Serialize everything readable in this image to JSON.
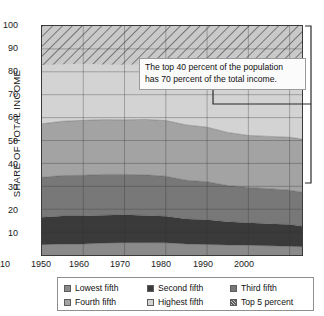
{
  "axis": {
    "ytitle": "SHARE OF TOTAL INCOME",
    "yticks": [
      "100",
      "90",
      "80",
      "70",
      "60",
      "50",
      "40",
      "30",
      "20",
      "10"
    ],
    "xticks": [
      "1950",
      "1960",
      "1970",
      "1980",
      "1990",
      "2000",
      "2010"
    ]
  },
  "callout": {
    "line1": "The top 40 percent of the population",
    "line2": "has 70 percent of the total income."
  },
  "legend": {
    "items": [
      {
        "label": "Lowest fifth",
        "color": "#8a8a8a",
        "hatch": false
      },
      {
        "label": "Second fifth",
        "color": "#3a3a3a",
        "hatch": false
      },
      {
        "label": "Third fifth",
        "color": "#787878",
        "hatch": false
      },
      {
        "label": "Fourth fifth",
        "color": "#a3a3a3",
        "hatch": false
      },
      {
        "label": "Highest fifth",
        "color": "#d3d3d3",
        "hatch": false
      },
      {
        "label": "Top 5 percent",
        "color": "#c4c4c4",
        "hatch": true
      }
    ]
  },
  "chart_data": {
    "type": "area",
    "title": "",
    "xlabel": "",
    "ylabel": "SHARE OF TOTAL INCOME",
    "xlim": [
      1950,
      2013
    ],
    "ylim": [
      0,
      100
    ],
    "grid": true,
    "stacked": true,
    "legend_position": "bottom",
    "annotations": [
      {
        "text": "The top 40 percent of the population has 70 percent of the total income.",
        "bracket_from": 100,
        "bracket_to": 30
      }
    ],
    "x": [
      1950,
      1955,
      1960,
      1965,
      1970,
      1975,
      1980,
      1985,
      1990,
      1995,
      2000,
      2005,
      2010,
      2013
    ],
    "series": [
      {
        "name": "Lowest fifth",
        "color": "#8a8a8a",
        "values": [
          4.5,
          4.8,
          4.8,
          5.2,
          5.4,
          5.4,
          5.3,
          4.8,
          4.6,
          4.4,
          4.3,
          4.0,
          3.8,
          3.6
        ]
      },
      {
        "name": "Second fifth",
        "color": "#3a3a3a",
        "values": [
          12.0,
          12.2,
          12.2,
          12.2,
          12.2,
          11.9,
          11.6,
          10.9,
          10.8,
          10.1,
          9.8,
          9.6,
          9.5,
          9.0
        ]
      },
      {
        "name": "Third fifth",
        "color": "#787878",
        "values": [
          17.4,
          17.7,
          17.8,
          17.8,
          17.6,
          17.7,
          17.5,
          16.9,
          16.6,
          15.8,
          15.4,
          15.3,
          15.0,
          14.8
        ]
      },
      {
        "name": "Fourth fifth",
        "color": "#a3a3a3",
        "values": [
          23.4,
          23.7,
          24.0,
          23.9,
          23.8,
          24.2,
          24.3,
          24.2,
          23.8,
          23.2,
          22.7,
          22.9,
          23.1,
          23.2
        ]
      },
      {
        "name": "Highest fifth",
        "color": "#d3d3d3",
        "values": [
          42.7,
          41.6,
          41.2,
          40.9,
          41.0,
          40.8,
          41.3,
          43.2,
          44.2,
          46.5,
          47.8,
          48.2,
          48.6,
          49.4
        ]
      }
    ],
    "cumulative_top_edges": {
      "lowest": [
        4.5,
        4.8,
        4.8,
        5.2,
        5.4,
        5.4,
        5.3,
        4.8,
        4.6,
        4.4,
        4.3,
        4.0,
        3.8,
        3.6
      ],
      "second": [
        16.5,
        17.0,
        17.0,
        17.4,
        17.6,
        17.3,
        16.9,
        15.7,
        15.4,
        14.5,
        14.1,
        13.6,
        13.3,
        12.6
      ],
      "third": [
        33.9,
        34.7,
        34.8,
        35.2,
        35.2,
        35.0,
        34.4,
        32.6,
        32.0,
        30.3,
        29.5,
        28.9,
        28.3,
        27.4
      ],
      "fourth": [
        57.3,
        58.4,
        58.8,
        59.1,
        59.0,
        59.2,
        58.7,
        56.8,
        55.8,
        53.5,
        52.2,
        51.8,
        51.4,
        50.6
      ],
      "highest": [
        100,
        100,
        100,
        100,
        100,
        100,
        100,
        100,
        100,
        100,
        100,
        100,
        100,
        100
      ]
    },
    "top5_band": {
      "name": "Top 5 percent",
      "color": "#c4c4c4",
      "hatched": true,
      "lower_edge": [
        83.0,
        83.3,
        83.5,
        83.2,
        83.1,
        83.3,
        83.6,
        82.9,
        82.3,
        81.0,
        80.3,
        80.1,
        79.8,
        79.2
      ]
    }
  }
}
